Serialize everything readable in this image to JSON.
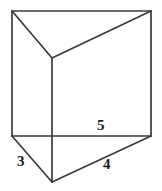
{
  "figure": {
    "name": "triangular-prism-diagram",
    "background_color": "#ffffff",
    "line_color": "#3b3b3b",
    "label_color": "#1a1a1a",
    "labels": [
      {
        "id": "label-3",
        "text": "3",
        "edge": "front-left-base-edge"
      },
      {
        "id": "label-5",
        "text": "5",
        "edge": "back-base-edge"
      },
      {
        "id": "label-4",
        "text": "4",
        "edge": "front-right-base-edge"
      }
    ],
    "vertices": {
      "top_left": [
        12,
        11
      ],
      "top_right": [
        151,
        11
      ],
      "top_back": [
        52,
        58
      ],
      "bottom_left": [
        12,
        136
      ],
      "bottom_right": [
        151,
        136
      ],
      "bottom_front": [
        52,
        182
      ]
    }
  }
}
